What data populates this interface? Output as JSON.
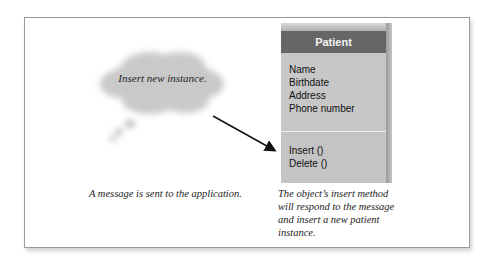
{
  "message_cloud": {
    "text": "Insert new instance."
  },
  "class_box": {
    "title": "Patient",
    "attributes": [
      "Name",
      "Birthdate",
      "Address",
      "Phone number"
    ],
    "methods": [
      "Insert ()",
      "Delete ()"
    ]
  },
  "captions": {
    "left": "A message is sent to the application.",
    "right": "The object’s insert method will respond to the message and insert a new patient instance."
  },
  "colors": {
    "header_bg": "#666666",
    "box_body": "#c7c7c7",
    "frame_border": "#9a9a9a",
    "arrow": "#111111"
  }
}
